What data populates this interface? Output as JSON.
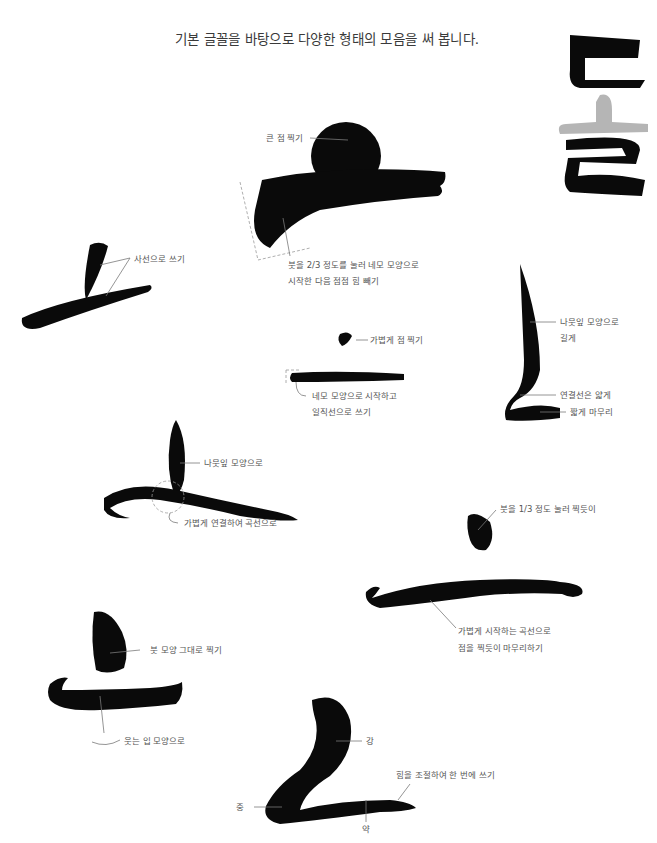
{
  "heading": "기본 글꼴을 바탕으로 다양한 형태의 모음을 써 봅니다.",
  "display_glyph": "돌",
  "colors": {
    "ink": "#0a0a0a",
    "accent_gray": "#b5b5b5",
    "label": "#555555",
    "leader": "#7a7a7a"
  },
  "annotations": {
    "big_dot": "큰 점 찍기",
    "brush_press": [
      "붓을 2/3 정도를 눌러 네모 모양으로",
      "시작한 다음 점점 힘 빼기"
    ],
    "diagonal": "사선으로 쓰기",
    "light_dot": "가볍게 점 찍기",
    "square_start": [
      "네모 모양으로 시작하고",
      "일직선으로 쓰기"
    ],
    "leaf_long": [
      "나뭇잎 모양으로",
      "길게"
    ],
    "thin_link": "연결선은 얇게",
    "short_finish": "짧게 마무리",
    "leaf": "나뭇잎 모양으로",
    "light_curve": "가볍게 연결하여 곡선으로",
    "third_press": "붓을 1/3 정도 눌러 찍듯이",
    "light_curve_start": [
      "가볍게 시작하는 곡선으로",
      "점을 찍듯이 마무리하기"
    ],
    "brush_shape": "붓 모양 그대로 찍기",
    "smile": "웃는 입 모양으로",
    "strong": "강",
    "medium": "중",
    "weak": "약",
    "one_stroke": "힘을 조절하여 한 번에 쓰기"
  }
}
